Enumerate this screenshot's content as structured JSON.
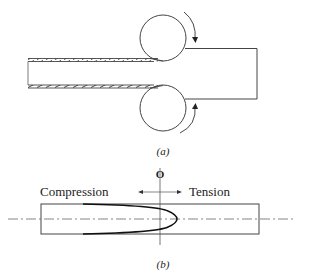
{
  "figure": {
    "panel_a": {
      "caption": "(a)",
      "description": "Tube passing between two rolls; hatched tube walls on left, solid workpiece on right",
      "rolls": [
        {
          "name": "upper-roll",
          "rotation": "clockwise"
        },
        {
          "name": "lower-roll",
          "rotation": "counter-clockwise"
        }
      ]
    },
    "panel_b": {
      "caption": "(b)",
      "origin_label": "O",
      "left_label": "Compression",
      "right_label": "Tension",
      "description": "Residual stress distribution across section: parabolic profile, compression near surfaces, tension at center"
    },
    "colors": {
      "line": "#333333",
      "background": "#ffffff"
    }
  }
}
